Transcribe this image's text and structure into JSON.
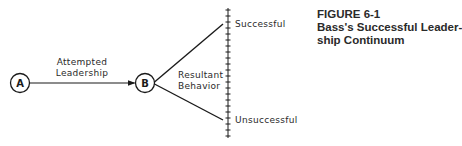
{
  "figure": {
    "number": "FIGURE 6-1",
    "title_line1": "Bass's Successful Leader-",
    "title_line2": "ship Continuum"
  },
  "nodes": {
    "a": {
      "label": "A"
    },
    "b": {
      "label": "B"
    }
  },
  "edges": {
    "a_to_b": {
      "line1": "Attempted",
      "line2": "Leadership"
    },
    "b_to_scale": {
      "line1": "Resultant",
      "line2": "Behavior"
    }
  },
  "scale": {
    "top_label": "Successful",
    "bottom_label": "Unsuccessful",
    "tick_count": 22
  },
  "colors": {
    "ink": "#1a1a1a",
    "background": "#ffffff"
  }
}
